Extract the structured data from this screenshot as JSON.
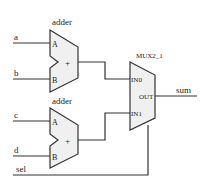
{
  "diagram": {
    "type": "circuit-schematic",
    "colors": {
      "stroke": "#333333",
      "fill": "#f0f0f0",
      "background": "#ffffff"
    },
    "adder_top": {
      "title": "adder",
      "port_a": "A",
      "port_b": "B",
      "op": "+"
    },
    "adder_bottom": {
      "title": "adder",
      "port_a": "A",
      "port_b": "B",
      "op": "+"
    },
    "mux": {
      "title": "MUX2_1",
      "in0": "IN0",
      "in1": "IN1",
      "out": "OUT"
    },
    "signals": {
      "a": "a",
      "b": "b",
      "c": "c",
      "d": "d",
      "sel": "sel",
      "sum": "sum"
    }
  }
}
